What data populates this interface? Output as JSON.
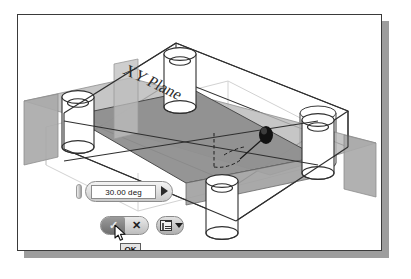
{
  "app": {
    "scene_title": "XY Plane",
    "operation": "work-plane-angle-rotation"
  },
  "viewport": {
    "plane_label": "XY Plane",
    "plane_fill": "#9a9a9a",
    "slab_fill": "#b4b4b4",
    "outline_color": "#2f2f2f",
    "handle_color": "#1a1a1a",
    "construction_color": "#c9c9c9"
  },
  "value_input": {
    "label_name": "angle-value",
    "value": "30.00 deg",
    "placeholder": "0.00 deg",
    "spinner_icon": "triangle-right-icon",
    "grip_icon": "drag-grip-icon"
  },
  "confirm_bar": {
    "ok_label": "✓",
    "ok_name": "OK",
    "cancel_label": "✕",
    "cancel_name": "Cancel",
    "ok_icon": "check-icon",
    "cancel_icon": "close-icon"
  },
  "options_button": {
    "icon": "list-menu-icon",
    "caret_icon": "chevron-down-icon",
    "label": ""
  },
  "tooltip": {
    "text": "OK"
  },
  "cursor": {
    "icon": "mouse-pointer-icon"
  },
  "window": {
    "background": "#ffffff",
    "border_color": "#3a3a3a",
    "shadow_color": "#9d9d9d"
  }
}
